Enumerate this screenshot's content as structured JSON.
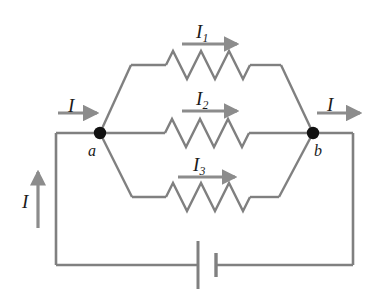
{
  "figure": {
    "name": "parallel-resistor-circuit-diagram",
    "colors": {
      "wire": "#808080",
      "arrow": "#8c8c8c",
      "node": "#111111",
      "text": "#1a1a1a",
      "background": "#ffffff"
    }
  },
  "labels": {
    "current_in": "I",
    "current_out": "I",
    "current_return": "I",
    "branch_1": "I",
    "branch_1_sub": "1",
    "branch_2": "I",
    "branch_2_sub": "2",
    "branch_3": "I",
    "branch_3_sub": "3",
    "node_a": "a",
    "node_b": "b"
  },
  "components": {
    "resistor_1": "resistor",
    "resistor_2": "resistor",
    "resistor_3": "resistor",
    "battery": "battery",
    "node_a_dot": "junction-node",
    "node_b_dot": "junction-node"
  }
}
